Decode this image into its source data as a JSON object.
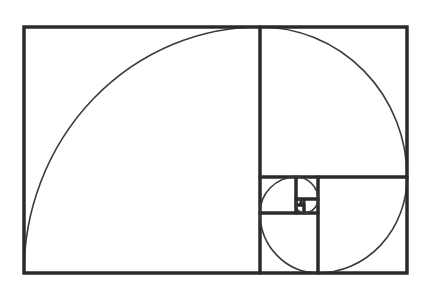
{
  "diagram": {
    "type": "golden-spiral",
    "title": "",
    "colors": {
      "background": "#ffffff",
      "line": "#2a2a2a",
      "spiral": "#3a3a3a"
    },
    "outer_rect": {
      "x": 24,
      "y": 27,
      "w": 383,
      "h": 246
    },
    "squares": [
      {
        "id": "A",
        "x": 24,
        "y": 27,
        "w": 236,
        "h": 246
      },
      {
        "id": "B",
        "x": 260,
        "y": 27,
        "w": 147,
        "h": 150
      },
      {
        "id": "C",
        "x": 318,
        "y": 177,
        "w": 89,
        "h": 96
      },
      {
        "id": "D",
        "x": 260,
        "y": 213,
        "w": 58,
        "h": 60
      },
      {
        "id": "E",
        "x": 260,
        "y": 177,
        "w": 36,
        "h": 36
      },
      {
        "id": "F",
        "x": 296,
        "y": 177,
        "w": 22,
        "h": 22
      },
      {
        "id": "G",
        "x": 304,
        "y": 199,
        "w": 14,
        "h": 14
      },
      {
        "id": "H",
        "x": 296,
        "y": 205,
        "w": 8,
        "h": 8
      },
      {
        "id": "I",
        "x": 296,
        "y": 199,
        "w": 5,
        "h": 6
      }
    ],
    "spiral_arcs": [
      {
        "id": "arc-A",
        "d": "M 24 273 A 236 246 0 0 1 260 27"
      },
      {
        "id": "arc-B",
        "d": "M 260 27 A 147 150 0 0 1 407 177"
      },
      {
        "id": "arc-C",
        "d": "M 407 177 A 89 96 0 0 1 318 273"
      },
      {
        "id": "arc-D",
        "d": "M 318 273 A 58 60 0 0 1 260 213"
      },
      {
        "id": "arc-E",
        "d": "M 260 213 A 36 36 0 0 1 296 177"
      },
      {
        "id": "arc-F",
        "d": "M 296 177 A 22 22 0 0 1 318 199"
      },
      {
        "id": "arc-G",
        "d": "M 318 199 A 14 14 0 0 1 304 213"
      },
      {
        "id": "arc-H",
        "d": "M 304 213 A 8 8 0 0 1 296 205"
      },
      {
        "id": "arc-I",
        "d": "M 296 205 A 5 6 0 0 1 301 199"
      }
    ]
  }
}
